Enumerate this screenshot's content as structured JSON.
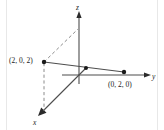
{
  "figure": {
    "kind": "3d-coordinate-axes-diagram",
    "background_color": "#ffffff",
    "line_color": "#4d4d4d",
    "dash_color": "#808080",
    "point_color": "#1a1a1a",
    "text_color": "#1a1a1a",
    "width": 164,
    "height": 130
  },
  "axes": {
    "z": {
      "label": "z",
      "direction": "up",
      "arrowhead": true
    },
    "y": {
      "label": "y",
      "direction": "right",
      "arrowhead": true
    },
    "x": {
      "label": "x",
      "direction": "down-left",
      "arrowhead": true
    },
    "origin_label": ""
  },
  "points": [
    {
      "name": "point-2-0-2",
      "label": "(2, 0, 2)",
      "x": 2,
      "y": 0,
      "z": 2,
      "marker": "filled-dot"
    },
    {
      "name": "point-0-2-0",
      "label": "(0, 2, 0)",
      "x": 0,
      "y": 2,
      "z": 0,
      "marker": "filled-dot"
    },
    {
      "name": "point-midpoint",
      "label": "",
      "marker": "filled-dot"
    }
  ],
  "segments": [
    {
      "name": "solid-segment-p1-p2",
      "style": "solid",
      "from": "(2, 0, 2)",
      "to": "(0, 2, 0)"
    },
    {
      "name": "dashed-projection-to-z-axis",
      "style": "dashed",
      "from": "(2, 0, 2)",
      "to": "z-axis"
    },
    {
      "name": "dashed-projection-to-x-axis",
      "style": "dashed",
      "from": "(2, 0, 2)",
      "to": "x-axis"
    }
  ]
}
